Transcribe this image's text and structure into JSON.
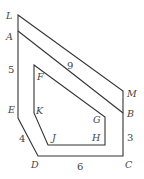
{
  "diagram": {
    "type": "polygon-figure",
    "colors": {
      "stroke": "#333333",
      "text": "#444444",
      "background": "#ffffff"
    },
    "vertices": {
      "L": {
        "label": "L",
        "x": 18,
        "y": 15
      },
      "A": {
        "label": "A",
        "x": 18,
        "y": 31
      },
      "M": {
        "label": "M",
        "x": 123,
        "y": 91
      },
      "B": {
        "label": "B",
        "x": 123,
        "y": 113
      },
      "C": {
        "label": "C",
        "x": 123,
        "y": 156
      },
      "D": {
        "label": "D",
        "x": 38,
        "y": 156
      },
      "E": {
        "label": "E",
        "x": 18,
        "y": 118
      },
      "F": {
        "label": "F",
        "x": 34,
        "y": 65
      },
      "K": {
        "label": "K",
        "x": 34,
        "y": 113
      },
      "J": {
        "label": "J",
        "x": 48,
        "y": 145
      },
      "H": {
        "label": "H",
        "x": 105,
        "y": 145
      },
      "G": {
        "label": "G",
        "x": 105,
        "y": 117
      }
    },
    "measurements": {
      "AE": "5",
      "ED": "4",
      "DC": "6",
      "CB": "3",
      "LM": "9"
    }
  }
}
